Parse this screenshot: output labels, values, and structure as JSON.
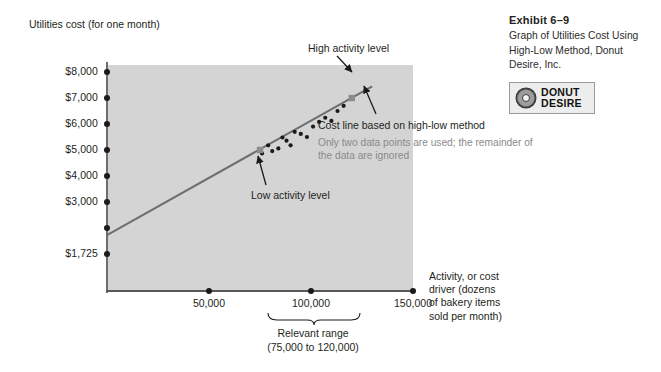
{
  "chart_title": "Utilities cost (for one month)",
  "x_axis_title": "Activity, or cost driver (dozens of bakery items sold per month)",
  "exhibit": {
    "number": "Exhibit 6–9",
    "caption": "Graph of Utilities Cost Using High-Low Method, Donut Desire, Inc.",
    "logo_line1": "DONUT",
    "logo_line2": "DESIRE",
    "logo_icon": "donut-icon"
  },
  "annotations": {
    "high_activity": "High activity level",
    "low_activity": "Low activity level",
    "cost_line": "Cost line based on high-low method",
    "note": "Only two data points are used; the remainder of the data are ignored",
    "relevant_range_label": "Relevant range",
    "relevant_range_values": "(75,000 to 120,000)"
  },
  "colors": {
    "plot_background": "#d4d4d4",
    "axis": "#58595b",
    "cost_line": "#6d6e71",
    "data_point": "#1a1a1a",
    "highlight_point": "#8c8c8c",
    "note_text": "#8a8a8a"
  },
  "chart_data": {
    "type": "scatter",
    "title": "Utilities cost (for one month)",
    "xlabel": "Activity, or cost driver (dozens of bakery items sold per month)",
    "ylabel": "Utilities cost (for one month)",
    "xlim": [
      0,
      150000
    ],
    "ylim": [
      0,
      8500
    ],
    "grid": false,
    "legend": "none",
    "y_ticks": [
      {
        "value": 8000,
        "label": "$8,000"
      },
      {
        "value": 7000,
        "label": "$7,000"
      },
      {
        "value": 6000,
        "label": "$6,000"
      },
      {
        "value": 5000,
        "label": "$5,000"
      },
      {
        "value": 4000,
        "label": "$4,000"
      },
      {
        "value": 3000,
        "label": "$3,000"
      },
      {
        "value": 2000,
        "label": ""
      },
      {
        "value": 1000,
        "label": ""
      }
    ],
    "y_intercept_label": "$1,725",
    "y_intercept_value": 1725,
    "x_ticks": [
      {
        "value": 50000,
        "label": "50,000"
      },
      {
        "value": 100000,
        "label": "100,000"
      },
      {
        "value": 150000,
        "label": "150,000"
      }
    ],
    "cost_line": {
      "name": "Cost line based on high-low method",
      "start": [
        0,
        1725
      ],
      "end": [
        130000,
        7450
      ]
    },
    "highlight_points": [
      {
        "name": "Low activity level",
        "x": 75000,
        "y": 5000
      },
      {
        "name": "High activity level",
        "x": 120000,
        "y": 7000
      }
    ],
    "points": [
      {
        "x": 76000,
        "y": 4870
      },
      {
        "x": 79000,
        "y": 5180
      },
      {
        "x": 81000,
        "y": 4960
      },
      {
        "x": 84000,
        "y": 5060
      },
      {
        "x": 86000,
        "y": 5480
      },
      {
        "x": 88000,
        "y": 5360
      },
      {
        "x": 90000,
        "y": 5180
      },
      {
        "x": 92000,
        "y": 5700
      },
      {
        "x": 95000,
        "y": 5620
      },
      {
        "x": 98000,
        "y": 5500
      },
      {
        "x": 101000,
        "y": 5900
      },
      {
        "x": 104000,
        "y": 6080
      },
      {
        "x": 107000,
        "y": 6240
      },
      {
        "x": 110000,
        "y": 6120
      },
      {
        "x": 113000,
        "y": 6500
      },
      {
        "x": 116000,
        "y": 6700
      }
    ],
    "relevant_range": {
      "from": 75000,
      "to": 120000,
      "label": "Relevant range"
    }
  }
}
